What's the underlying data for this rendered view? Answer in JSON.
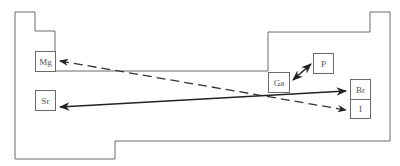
{
  "diagram": {
    "type": "periodic-table-outline",
    "colors": {
      "outline": "#6a6a6a",
      "arrow": "#222222",
      "box_border": "#6a6a6a",
      "text": "#555555"
    },
    "elements": [
      {
        "symbol": "Mg",
        "x": 35,
        "y": 51,
        "w": 21,
        "h": 21
      },
      {
        "symbol": "Sr",
        "x": 35,
        "y": 90,
        "w": 21,
        "h": 21
      },
      {
        "symbol": "Ga",
        "x": 268,
        "y": 72,
        "w": 22,
        "h": 21
      },
      {
        "symbol": "P",
        "x": 313,
        "y": 53,
        "w": 21,
        "h": 21
      },
      {
        "symbol": "Br",
        "x": 350,
        "y": 79,
        "w": 21,
        "h": 20
      },
      {
        "symbol": "I",
        "x": 350,
        "y": 99,
        "w": 21,
        "h": 20
      }
    ],
    "arrows": [
      {
        "from": "Mg",
        "to": "I",
        "style": "dashed",
        "double_headed": true
      },
      {
        "from": "Sr",
        "to": "Br",
        "style": "solid",
        "double_headed": true
      },
      {
        "from": "Ga",
        "to": "P",
        "style": "solid",
        "double_headed": true
      }
    ]
  }
}
